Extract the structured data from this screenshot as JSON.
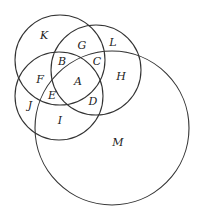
{
  "diagram": {
    "type": "venn",
    "circles": [
      {
        "id": "top-left"
      },
      {
        "id": "top-right"
      },
      {
        "id": "middle-left"
      },
      {
        "id": "large-bottom"
      }
    ],
    "regions": [
      {
        "id": "K",
        "label": "K"
      },
      {
        "id": "G",
        "label": "G"
      },
      {
        "id": "L",
        "label": "L"
      },
      {
        "id": "B",
        "label": "B"
      },
      {
        "id": "C",
        "label": "C"
      },
      {
        "id": "F",
        "label": "F"
      },
      {
        "id": "A",
        "label": "A"
      },
      {
        "id": "H",
        "label": "H"
      },
      {
        "id": "E",
        "label": "E"
      },
      {
        "id": "J",
        "label": "J"
      },
      {
        "id": "D",
        "label": "D"
      },
      {
        "id": "I",
        "label": "I"
      },
      {
        "id": "M",
        "label": "M"
      }
    ]
  }
}
